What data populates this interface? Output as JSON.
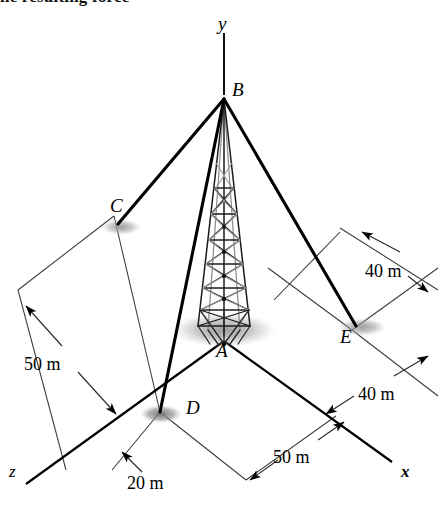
{
  "figure": {
    "caption_fragment": "he resulting force",
    "background_color": "#ffffff",
    "line_color": "#000000",
    "shadow_color": "#9a9a9a",
    "width": 444,
    "height": 517
  },
  "axes": [
    {
      "name": "y-axis",
      "label": "y",
      "x": 218,
      "y": 14
    },
    {
      "name": "z-axis",
      "label": "z",
      "x": 9,
      "y": 463
    },
    {
      "name": "x-axis",
      "label": "x",
      "x": 401,
      "y": 463
    }
  ],
  "points": [
    {
      "name": "point-b",
      "label": "B",
      "x": 232,
      "y": 80,
      "role": "tower-apex"
    },
    {
      "name": "point-a",
      "label": "A",
      "x": 216,
      "y": 341,
      "role": "tower-base"
    },
    {
      "name": "point-c",
      "label": "C",
      "x": 110,
      "y": 196,
      "role": "anchor"
    },
    {
      "name": "point-d",
      "label": "D",
      "x": 186,
      "y": 398,
      "role": "anchor"
    },
    {
      "name": "point-e",
      "label": "E",
      "x": 340,
      "y": 327,
      "role": "anchor"
    }
  ],
  "dimensions": [
    {
      "name": "dimension-50m-left",
      "label": "50 m",
      "x": 24,
      "y": 355
    },
    {
      "name": "dimension-40m-upper-right",
      "label": "40 m",
      "x": 365,
      "y": 262
    },
    {
      "name": "dimension-40m-lower-right",
      "label": "40 m",
      "x": 358,
      "y": 385
    },
    {
      "name": "dimension-50m-bottom",
      "label": "50 m",
      "x": 273,
      "y": 448
    },
    {
      "name": "dimension-20m-bottom-left",
      "label": "20 m",
      "x": 127,
      "y": 474
    }
  ],
  "cables": [
    {
      "name": "cable-b-to-c",
      "from": "B",
      "to": "C"
    },
    {
      "name": "cable-b-to-d",
      "from": "B",
      "to": "D"
    },
    {
      "name": "cable-b-to-e",
      "from": "B",
      "to": "E"
    }
  ]
}
